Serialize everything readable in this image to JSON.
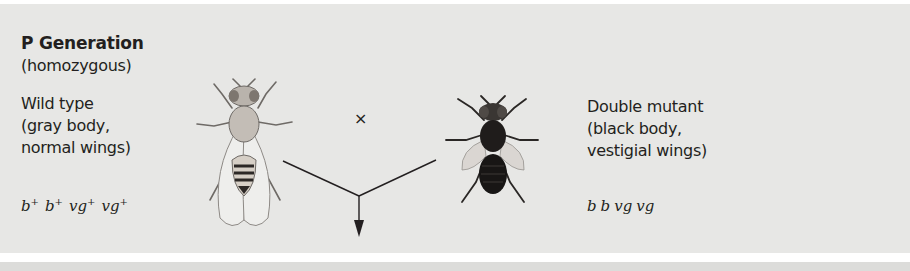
{
  "generation": {
    "title": "P Generation",
    "subtitle": "(homozygous)"
  },
  "parent_left": {
    "phenotype_lines": [
      "Wild type",
      "(gray body,",
      "normal wings)"
    ],
    "genotype": [
      {
        "base": "b",
        "sup": "+"
      },
      {
        "base": "b",
        "sup": "+"
      },
      {
        "base": "vg",
        "sup": "+"
      },
      {
        "base": "vg",
        "sup": "+"
      }
    ],
    "icon": "wild-type-fly-icon"
  },
  "parent_right": {
    "phenotype_lines": [
      "Double mutant",
      "(black body,",
      "vestigial wings)"
    ],
    "genotype": [
      {
        "base": "b",
        "sup": ""
      },
      {
        "base": "b",
        "sup": ""
      },
      {
        "base": "vg",
        "sup": ""
      },
      {
        "base": "vg",
        "sup": ""
      }
    ],
    "icon": "double-mutant-fly-icon"
  },
  "cross_symbol": "×",
  "colors": {
    "panel": "#e7e7e5",
    "text": "#231f20",
    "line": "#231f20"
  }
}
